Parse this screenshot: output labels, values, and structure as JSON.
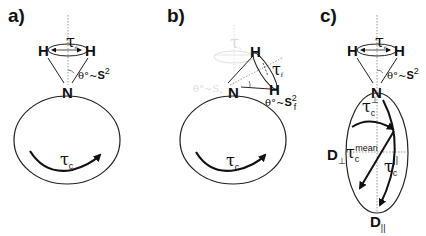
{
  "panels": [
    {
      "label": "a)",
      "atoms": {
        "h_left": "H",
        "h_right": "H",
        "n": "N"
      },
      "tau_local": "τ",
      "tau_local_sub": "e",
      "angle_prefix": "θ°~",
      "order_param": "S",
      "order_sup": "2",
      "tau_global": "τ",
      "tau_global_sub": "c"
    },
    {
      "label": "b)",
      "atoms": {
        "h_top": "H",
        "h_right": "H",
        "n": "N"
      },
      "tau_local": "τ",
      "tau_local_sub": "f",
      "angle_prefix": "θ°~",
      "order_param": "S",
      "order_sup": "2",
      "order_sub": "f",
      "ghost_tau": "τ",
      "ghost_tau_sub": "s",
      "ghost_angle": "θ°~S",
      "ghost_angle_sub": "s",
      "tau_global": "τ",
      "tau_global_sub": "c"
    },
    {
      "label": "c)",
      "atoms": {
        "h_left": "H",
        "h_right": "H",
        "n": "N"
      },
      "tau_local": "τ",
      "tau_local_sub": "e",
      "angle_prefix": "θ°~",
      "order_param": "S",
      "order_sup": "2",
      "tau_perp": "τ",
      "tau_perp_sub": "c",
      "tau_perp_sup": "⊥",
      "tau_mean": "τ",
      "tau_mean_sub": "c",
      "tau_mean_sup": "mean",
      "tau_par": "τ",
      "tau_par_sub": "c",
      "tau_par_sup": "||",
      "d_perp": "D",
      "d_perp_sub": "⊥",
      "d_par": "D",
      "d_par_sub": "||"
    }
  ]
}
